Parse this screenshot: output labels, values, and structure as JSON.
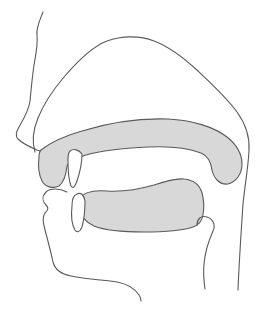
{
  "figure": {
    "canvas": {
      "width": 265,
      "height": 319
    },
    "background_color": "#ffffff",
    "stroke_color": "#5a5a5a",
    "stroke_width": 1.1,
    "shade_color": "#d8d8d8",
    "tooth_color": "#ffffff",
    "shapes": [
      {
        "name": "palate-velum-shape",
        "fill": "shade",
        "d": "M 41 150 C 50 143 64 136 82 131 C 108 123 140 118 168 119 C 192 120 214 127 227 137 C 237 145 242 155 242 164 C 242 174 236 182 228 184 C 220 185 214 179 212 170 C 211 162 208 156 201 153 C 188 148 168 146 148 147 C 125 148 103 150 86 155 C 76 158 69 162 67 166 C 66 175 64 182 59 186 C 53 189 45 187 42 181 C 39 175 38 165 39 157 C 39 153 40 151 41 150 Z"
      },
      {
        "name": "tongue-shape",
        "fill": "shade",
        "d": "M 80 198 C 84 192 94 190 107 191 C 124 192 140 189 154 185 C 166 181 176 178 184 179 C 194 180 200 186 202 193 C 204 200 204 209 203 215 C 202 221 199 225 193 227 C 181 231 162 232 144 232 C 124 232 104 230 94 226 C 85 222 79 214 78 207 C 78 203 79 200 80 198 Z"
      },
      {
        "name": "face-profile-line",
        "fill": "none",
        "d": "M 43 12 C 40 20 36 27 37 35 C 38 45 36 54 34 65 C 32 79 31 91 30 101 C 29 109 25 117 19 127 C 16 132 15 136 18 139 C 22 143 30 147 37 150 L 40 151"
      },
      {
        "name": "cranium-and-pharynx-line",
        "fill": "none",
        "d": "M 35 152 C 32 142 33 130 38 118 C 44 103 53 90 64 77 C 76 63 91 47 107 41 C 121 36 139 35 154 41 C 170 47 184 58 198 71 C 213 85 227 98 237 112 C 245 123 250 136 249 151 C 248 169 245 184 243 204 C 241 234 239 263 238 290"
      },
      {
        "name": "upper-incisor-tooth",
        "fill": "tooth",
        "d": "M 70 151 C 74 148 79 150 82 154 C 82 162 80 172 77 181 C 75 187 73 189 71 186 C 69 181 68 170 68 160 C 68 155 69 152 70 151 Z"
      },
      {
        "name": "lower-incisor-tooth",
        "fill": "tooth",
        "d": "M 77 194 C 81 192 84 195 85 201 C 85 210 84 220 82 227 C 80 232 77 233 75 230 C 72 225 71 215 72 206 C 72 199 74 195 77 194 Z"
      },
      {
        "name": "lower-lip-chin-jaw-line",
        "fill": "none",
        "d": "M 67 192 C 59 188 50 188 46 192 C 42 196 42 201 46 205 C 49 208 48 210 45 213 C 42 217 43 223 45 230 C 48 241 51 253 53 262 C 55 270 61 274 71 276 C 85 279 103 280 117 282 C 128 284 135 289 139 295 C 141 298 141 300 141 301"
      },
      {
        "name": "epiglottis-larynx-line",
        "fill": "none",
        "d": "M 197 225 C 197 219 201 215 207 217 C 213 219 216 225 213 231 C 209 240 205 252 204 264 C 203 274 204 282 205 289"
      }
    ]
  }
}
